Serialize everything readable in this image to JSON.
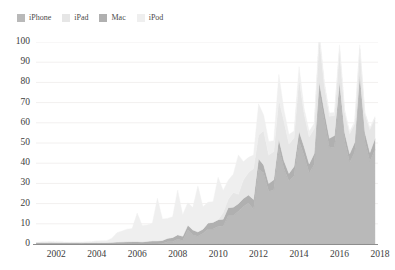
{
  "legend": {
    "position": "top-left",
    "items": [
      {
        "label": "iPhone",
        "color": "#b9b9b9"
      },
      {
        "label": "iPad",
        "color": "#e6e6e6"
      },
      {
        "label": "Mac",
        "color": "#b0b0b0"
      },
      {
        "label": "iPod",
        "color": "#efefef"
      }
    ]
  },
  "chart_data": {
    "type": "area",
    "stacked": true,
    "title": "",
    "subtitle": "",
    "xlabel": "",
    "ylabel": "",
    "xlim": [
      2001.0,
      2017.9
    ],
    "ylim": [
      0,
      100
    ],
    "grid": true,
    "grid_axis": "y",
    "xticks": [
      2002,
      2004,
      2006,
      2008,
      2010,
      2012,
      2014,
      2016,
      2018
    ],
    "xtick_labels": [
      "2002",
      "2004",
      "2006",
      "2008",
      "2010",
      "2012",
      "2014",
      "2016",
      "2018"
    ],
    "yticks": [
      0,
      10,
      20,
      30,
      40,
      50,
      60,
      70,
      80,
      90,
      100
    ],
    "ytick_labels": [
      "0",
      "10",
      "20",
      "30",
      "40",
      "50",
      "60",
      "70",
      "80",
      "90",
      "100"
    ],
    "x_unit": "calendar quarter",
    "y_unit": "millions of units",
    "stack_order_bottom_to_top": [
      "iPhone",
      "Mac",
      "iPad",
      "iPod"
    ],
    "x": [
      2001.0,
      2001.25,
      2001.5,
      2001.75,
      2002.0,
      2002.25,
      2002.5,
      2002.75,
      2003.0,
      2003.25,
      2003.5,
      2003.75,
      2004.0,
      2004.25,
      2004.5,
      2004.75,
      2005.0,
      2005.25,
      2005.5,
      2005.75,
      2006.0,
      2006.25,
      2006.5,
      2006.75,
      2007.0,
      2007.25,
      2007.5,
      2007.75,
      2008.0,
      2008.25,
      2008.5,
      2008.75,
      2009.0,
      2009.25,
      2009.5,
      2009.75,
      2010.0,
      2010.25,
      2010.5,
      2010.75,
      2011.0,
      2011.25,
      2011.5,
      2011.75,
      2012.0,
      2012.25,
      2012.5,
      2012.75,
      2013.0,
      2013.25,
      2013.5,
      2013.75,
      2014.0,
      2014.25,
      2014.5,
      2014.75,
      2015.0,
      2015.25,
      2015.5,
      2015.75,
      2016.0,
      2016.25,
      2016.5,
      2016.75,
      2017.0,
      2017.25,
      2017.5,
      2017.75
    ],
    "series": [
      {
        "name": "iPhone",
        "color": "#b9b9b9",
        "values": [
          0,
          0,
          0,
          0,
          0,
          0,
          0,
          0,
          0,
          0,
          0,
          0,
          0,
          0,
          0,
          0,
          0,
          0,
          0,
          0,
          0,
          0,
          0,
          0,
          0,
          0.3,
          1.1,
          1.1,
          2.3,
          1.7,
          6.9,
          4.4,
          3.8,
          5.2,
          7.4,
          7.4,
          8.7,
          8.8,
          14.1,
          14.1,
          16.2,
          18.6,
          20.3,
          17.1,
          37.0,
          35.1,
          26.0,
          26.9,
          47.8,
          37.4,
          31.2,
          33.8,
          51.0,
          43.7,
          35.2,
          39.3,
          74.5,
          61.2,
          47.5,
          48.0,
          74.8,
          51.2,
          40.4,
          45.5,
          78.3,
          51.2,
          41.0,
          46.7
        ]
      },
      {
        "name": "Mac",
        "color": "#b0b0b0",
        "values": [
          0.7,
          0.8,
          0.8,
          0.85,
          0.8,
          0.8,
          0.75,
          0.75,
          0.75,
          0.7,
          0.75,
          0.8,
          0.8,
          0.75,
          0.8,
          0.85,
          1.05,
          1.07,
          1.18,
          1.23,
          1.25,
          1.11,
          1.33,
          1.6,
          1.6,
          1.5,
          1.76,
          2.16,
          2.3,
          2.2,
          2.5,
          2.6,
          2.25,
          2.2,
          3.05,
          3.36,
          3.36,
          3.47,
          3.89,
          4.13,
          3.76,
          3.95,
          3.95,
          4.89,
          5.2,
          4.0,
          4.0,
          4.9,
          4.06,
          3.95,
          3.75,
          4.57,
          4.84,
          4.41,
          4.41,
          5.52,
          5.52,
          4.56,
          4.8,
          5.71,
          5.31,
          4.03,
          4.25,
          4.89,
          5.37,
          4.2,
          4.29,
          5.39
        ]
      },
      {
        "name": "iPad",
        "color": "#e6e6e6",
        "values": [
          0,
          0,
          0,
          0,
          0,
          0,
          0,
          0,
          0,
          0,
          0,
          0,
          0,
          0,
          0,
          0,
          0,
          0,
          0,
          0,
          0,
          0,
          0,
          0,
          0,
          0,
          0,
          0,
          0,
          0,
          0,
          0,
          0,
          0,
          0,
          0,
          0,
          3.3,
          4.2,
          7.3,
          4.7,
          9.2,
          11.1,
          15.4,
          11.8,
          17.0,
          14.0,
          14.0,
          19.5,
          19.5,
          14.6,
          14.1,
          26.0,
          16.3,
          13.3,
          12.3,
          21.4,
          12.6,
          10.9,
          9.9,
          16.1,
          10.2,
          9.9,
          9.3,
          13.1,
          9.2,
          11.4,
          10.3
        ]
      },
      {
        "name": "iPod",
        "color": "#efefef",
        "values": [
          0,
          0,
          0.125,
          0.125,
          0.057,
          0.054,
          0.14,
          0.219,
          0.219,
          0.304,
          0.336,
          0.336,
          0.733,
          0.807,
          0.86,
          2.016,
          4.58,
          5.31,
          6.16,
          6.45,
          14.04,
          8.11,
          8.11,
          8.73,
          21.07,
          10.55,
          9.82,
          10.2,
          22.12,
          10.64,
          11.01,
          11.05,
          22.73,
          11.01,
          10.21,
          10.18,
          20.97,
          10.89,
          9.41,
          9.05,
          19.45,
          9.02,
          7.54,
          6.62,
          15.4,
          7.7,
          6.8,
          5.3,
          12.7,
          5.6,
          4.6,
          3.5,
          6.0,
          2.7,
          2.9,
          2.6,
          4.0,
          1.9,
          1.7,
          1.5,
          2.4,
          1.2,
          1.1,
          1.0,
          1.8,
          0.9,
          0.8,
          0.7
        ]
      }
    ],
    "notes": {
      "peak_total_value": 101.1,
      "peak_total_quarter": "2015.0",
      "seasonality": "Q1 (holiday) peaks each year"
    }
  }
}
